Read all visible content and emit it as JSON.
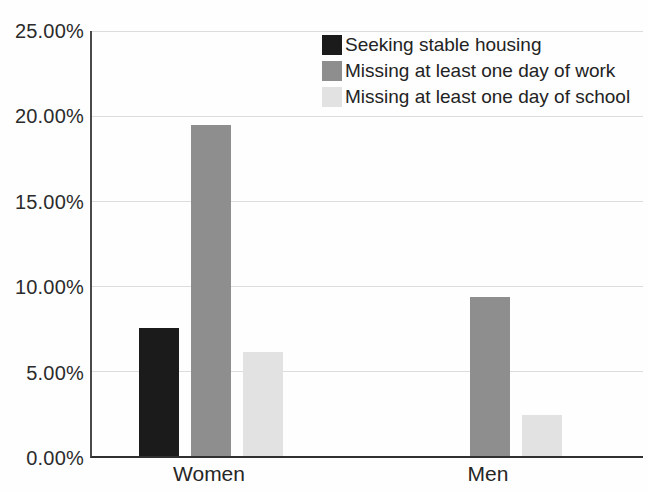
{
  "chart_data": {
    "type": "bar",
    "title": "",
    "categories": [
      "Women",
      "Men"
    ],
    "series": [
      {
        "name": "Seeking stable housing",
        "color": "#1b1b1b",
        "values": [
          7.5,
          null
        ]
      },
      {
        "name": "Missing at least one day of work",
        "color": "#8e8e8e",
        "values": [
          19.4,
          9.3
        ]
      },
      {
        "name": "Missing at least one day of school",
        "color": "#e2e2e2",
        "values": [
          6.1,
          2.4
        ]
      }
    ],
    "xlabel": "",
    "ylabel": "",
    "ylim": [
      0,
      25
    ],
    "ytick_step": 5,
    "ytick_labels": [
      "0.00%",
      "5.00%",
      "10.00%",
      "15.00%",
      "20.00%",
      "25.00%"
    ],
    "grid": true,
    "legend_position": "top-center-inside"
  },
  "axis_colors": {
    "gridline": "#dcdcdc",
    "axis_line": "#3a3a3a",
    "tick_text": "#2b2b2b"
  }
}
